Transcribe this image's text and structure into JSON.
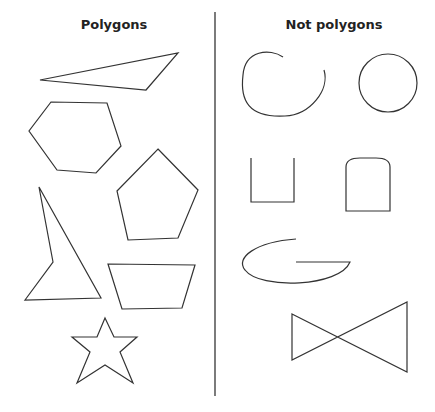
{
  "left_column": {
    "title": "Polygons",
    "shapes": [
      "triangle",
      "hexagon",
      "pentagon",
      "concave-quadrilateral",
      "trapezoid",
      "star"
    ]
  },
  "right_column": {
    "title": "Not polygons",
    "shapes": [
      "open-curve",
      "circle",
      "open-rectangle",
      "rounded-top-shape",
      "curved-g-shape",
      "self-intersecting-bowtie"
    ]
  },
  "colors": {
    "stroke": "#333333",
    "background": "#ffffff"
  }
}
